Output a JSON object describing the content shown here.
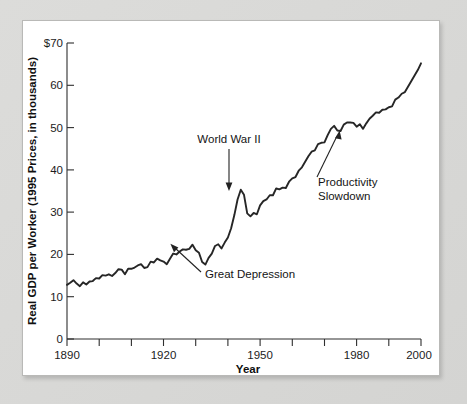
{
  "figure": {
    "panel_background": "#ffffff",
    "outer_background": "#d8d8d6",
    "line_color": "#262626"
  },
  "chart_data": {
    "type": "line",
    "title": "",
    "subtitle": "",
    "xlabel": "Year",
    "ylabel": "Real GDP per Worker (1995 Prices, in thousands)",
    "xlim": [
      1890,
      2000
    ],
    "ylim": [
      0,
      70
    ],
    "grid": false,
    "legend": "none",
    "x_ticks": [
      1890,
      1900,
      1910,
      1920,
      1930,
      1940,
      1950,
      1960,
      1970,
      1980,
      1990,
      2000
    ],
    "x_tick_labels": [
      "1890",
      "",
      "",
      "1920",
      "",
      "",
      "1950",
      "",
      "",
      "1980",
      "",
      "2000"
    ],
    "y_ticks": [
      0,
      10,
      20,
      30,
      40,
      50,
      60,
      70
    ],
    "y_tick_labels": [
      "0",
      "10",
      "20",
      "30",
      "40",
      "50",
      "60",
      "$70"
    ],
    "series": [
      {
        "name": "Real GDP per Worker",
        "x": [
          1890,
          1891,
          1892,
          1893,
          1894,
          1895,
          1896,
          1897,
          1898,
          1899,
          1900,
          1901,
          1902,
          1903,
          1904,
          1905,
          1906,
          1907,
          1908,
          1909,
          1910,
          1911,
          1912,
          1913,
          1914,
          1915,
          1916,
          1917,
          1918,
          1919,
          1920,
          1921,
          1922,
          1923,
          1924,
          1925,
          1926,
          1927,
          1928,
          1929,
          1930,
          1931,
          1932,
          1933,
          1934,
          1935,
          1936,
          1937,
          1938,
          1939,
          1940,
          1941,
          1942,
          1943,
          1944,
          1945,
          1946,
          1947,
          1948,
          1949,
          1950,
          1951,
          1952,
          1953,
          1954,
          1955,
          1956,
          1957,
          1958,
          1959,
          1960,
          1961,
          1962,
          1963,
          1964,
          1965,
          1966,
          1967,
          1968,
          1969,
          1970,
          1971,
          1972,
          1973,
          1974,
          1975,
          1976,
          1977,
          1978,
          1979,
          1980,
          1981,
          1982,
          1983,
          1984,
          1985,
          1986,
          1987,
          1988,
          1989,
          1990,
          1991,
          1992,
          1993,
          1994,
          1995,
          1996,
          1997,
          1998,
          1999,
          2000
        ],
        "values": [
          12.8,
          13.3,
          13.9,
          13.1,
          12.5,
          13.4,
          12.9,
          13.6,
          13.7,
          14.4,
          14.3,
          15.1,
          15.0,
          15.3,
          14.9,
          15.6,
          16.5,
          16.4,
          15.3,
          16.6,
          16.6,
          16.9,
          17.4,
          17.7,
          16.8,
          17.0,
          18.3,
          18.1,
          19.0,
          18.6,
          18.3,
          17.7,
          19.0,
          20.2,
          20.0,
          20.7,
          21.2,
          21.1,
          21.3,
          22.3,
          21.0,
          20.4,
          18.2,
          17.6,
          19.2,
          20.2,
          22.0,
          22.4,
          21.4,
          22.8,
          24.0,
          26.2,
          29.3,
          33.0,
          35.3,
          34.1,
          29.7,
          29.0,
          29.8,
          29.5,
          31.6,
          32.6,
          33.0,
          34.0,
          34.0,
          35.6,
          35.4,
          35.8,
          35.7,
          37.2,
          38.0,
          38.3,
          39.8,
          40.6,
          41.9,
          43.2,
          44.3,
          44.6,
          46.1,
          46.4,
          46.5,
          48.2,
          49.7,
          50.4,
          49.3,
          49.2,
          50.7,
          51.2,
          51.2,
          51.1,
          50.2,
          50.8,
          49.7,
          51.0,
          52.1,
          52.8,
          53.6,
          53.5,
          54.2,
          54.3,
          54.8,
          55.0,
          56.6,
          57.1,
          58.0,
          58.4,
          59.7,
          61.0,
          62.3,
          63.6,
          65.2
        ]
      }
    ],
    "annotations": [
      {
        "id": "world-war-ii",
        "label": "World War II",
        "label_lines": [
          "World War II"
        ],
        "target_year": 1944,
        "target_value": 35.3,
        "arrow": "down"
      },
      {
        "id": "great-depression",
        "label": "Great Depression",
        "label_lines": [
          "Great Depression"
        ],
        "target_year": 1933,
        "target_value": 17.6,
        "arrow": "up-left"
      },
      {
        "id": "productivity-slowdown",
        "label": "Productivity Slowdown",
        "label_lines": [
          "Productivity",
          "Slowdown"
        ],
        "target_year": 1974,
        "target_value": 49.3,
        "arrow": "up-left"
      }
    ]
  },
  "labels": {
    "y_axis_title": "Real GDP per Worker (1995 Prices, in thousands)",
    "x_axis_title": "Year",
    "y_top": "$70",
    "y_60": "60",
    "y_50": "50",
    "y_40": "40",
    "y_30": "30",
    "y_20": "20",
    "y_10": "10",
    "y_0": "0",
    "x_1890": "1890",
    "x_1920": "1920",
    "x_1950": "1950",
    "x_1980": "1980",
    "x_2000": "2000",
    "annot_wwii": "World War II",
    "annot_depression": "Great Depression",
    "annot_slow_1": "Productivity",
    "annot_slow_2": "Slowdown"
  }
}
